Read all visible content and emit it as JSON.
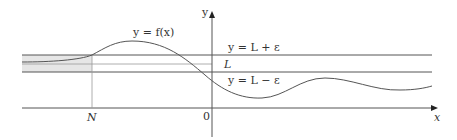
{
  "diagram": {
    "type": "limit-at-negative-infinity-illustration",
    "curve_label": "y = f(x)",
    "upper_band_label": "y = L + ε",
    "limit_label": "L",
    "lower_band_label": "y = L − ε",
    "x_axis_label": "x",
    "y_axis_label": "y",
    "origin_label": "0",
    "n_label": "N",
    "colors": {
      "line": "#555555",
      "shade": "#e6e6e6",
      "text": "#333333"
    }
  }
}
